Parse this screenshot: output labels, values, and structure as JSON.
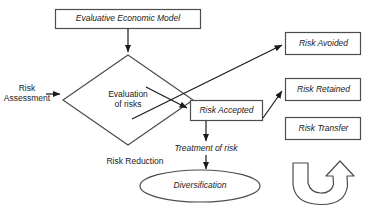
{
  "diagram": {
    "canvas": {
      "width": 371,
      "height": 211
    },
    "colors": {
      "background": "#ffffff",
      "stroke": "#4d4d4d",
      "text": "#1a1a1a",
      "arrow_fill": "#1a1a1a"
    },
    "nodes": {
      "evaluative_economic_model": {
        "label": "Evaluative Economic Model",
        "shape": "rectangle",
        "style": "italic"
      },
      "risk_assessment": {
        "label": "Risk\nAssessment",
        "shape": "text",
        "style": "plain"
      },
      "evaluation_of_risks": {
        "label": "Evaluation\nof risks",
        "shape": "diamond",
        "style": "plain"
      },
      "risk_accepted": {
        "label": "Risk Accepted",
        "shape": "rectangle",
        "style": "italic"
      },
      "risk_avoided": {
        "label": "Risk Avoided",
        "shape": "rectangle",
        "style": "italic"
      },
      "risk_retained": {
        "label": "Risk Retained",
        "shape": "rectangle",
        "style": "italic"
      },
      "risk_transfer": {
        "label": "Risk Transfer",
        "shape": "rectangle",
        "style": "italic"
      },
      "treatment_of_risk": {
        "label": "Treatment of risk",
        "shape": "text",
        "style": "italic"
      },
      "risk_reduction": {
        "label": "Risk Reduction",
        "shape": "text",
        "style": "plain"
      },
      "diversification": {
        "label": "Diversification",
        "shape": "ellipse",
        "style": "italic"
      },
      "curved_arrow": {
        "label": "",
        "shape": "curved-arrow",
        "style": "outline"
      }
    },
    "edges": [
      {
        "from": "evaluative_economic_model",
        "to": "evaluation_of_risks",
        "kind": "arrow"
      },
      {
        "from": "risk_assessment",
        "to": "evaluation_of_risks",
        "kind": "arrow"
      },
      {
        "from": "evaluation_of_risks",
        "to": "risk_accepted",
        "kind": "arrow"
      },
      {
        "from": "evaluation_of_risks",
        "to": "risk_avoided",
        "kind": "arrow"
      },
      {
        "from": "risk_accepted",
        "to": "risk_retained",
        "kind": "arrow"
      },
      {
        "from": "risk_accepted",
        "to": "treatment_of_risk",
        "kind": "arrow"
      },
      {
        "from": "treatment_of_risk",
        "to": "diversification",
        "kind": "arrow"
      }
    ]
  }
}
